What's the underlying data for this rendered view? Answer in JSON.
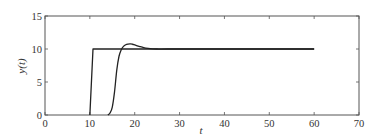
{
  "chart_data": {
    "type": "line",
    "title": "",
    "xlabel": "t",
    "ylabel": "y(t)",
    "xlim": [
      0,
      70
    ],
    "ylim": [
      0,
      15
    ],
    "xticks": [
      0,
      10,
      20,
      30,
      40,
      50,
      60,
      70
    ],
    "yticks": [
      0,
      5,
      10,
      15
    ],
    "grid": false,
    "legend": null,
    "series": [
      {
        "name": "step-reference",
        "color": "#222222",
        "x": [
          10,
          10.7,
          60
        ],
        "y": [
          0,
          10,
          10
        ]
      },
      {
        "name": "response",
        "color": "#222222",
        "x": [
          14,
          14.5,
          15,
          15.5,
          16,
          16.5,
          17,
          17.5,
          18,
          18.5,
          19,
          19.5,
          20,
          21,
          22,
          23,
          24,
          25,
          26,
          28,
          30,
          35,
          40,
          50,
          60
        ],
        "y": [
          0,
          0.3,
          1.2,
          3.5,
          6.8,
          8.9,
          9.9,
          10.4,
          10.65,
          10.75,
          10.78,
          10.72,
          10.62,
          10.4,
          10.2,
          10.08,
          10.02,
          10.0,
          9.99,
          10.0,
          10.0,
          10.0,
          10.0,
          10.0,
          10.0
        ]
      }
    ]
  },
  "axes": {
    "xlabel": "t",
    "ylabel": "y(t)"
  }
}
